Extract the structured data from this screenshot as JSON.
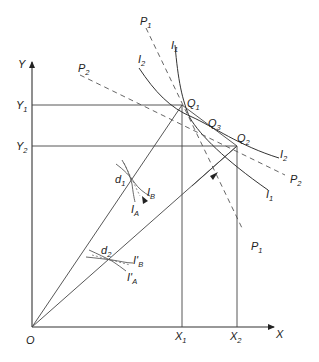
{
  "diagram": {
    "type": "edgeworth-box-style production possibility / isoquant diagram",
    "axes": {
      "origin_label": "O",
      "x_axis_label": "X",
      "y_axis_label": "Y"
    },
    "tick_labels": {
      "x": [
        {
          "main": "X",
          "sub": "1"
        },
        {
          "main": "X",
          "sub": "2"
        }
      ],
      "y": [
        {
          "main": "Y",
          "sub": "1"
        },
        {
          "main": "Y",
          "sub": "2"
        }
      ]
    },
    "points": [
      {
        "main": "Q",
        "sub": "1"
      },
      {
        "main": "Q",
        "sub": "2"
      },
      {
        "main": "Q",
        "sub": "3"
      },
      {
        "main": "d",
        "sub": "1"
      },
      {
        "main": "d",
        "sub": "2"
      }
    ],
    "curves": {
      "I1": {
        "main": "I",
        "sub": "1"
      },
      "I2": {
        "main": "I",
        "sub": "2"
      },
      "I1_end": {
        "main": "I",
        "sub": "1"
      },
      "I2_end": {
        "main": "I",
        "sub": "2"
      }
    },
    "price_lines": {
      "P1_top": {
        "main": "P",
        "sub": "1"
      },
      "P1_bottom": {
        "main": "P",
        "sub": "1"
      },
      "P2_left": {
        "main": "P",
        "sub": "2"
      },
      "P2_right": {
        "main": "P",
        "sub": "2"
      }
    },
    "isoquants_d1": {
      "IB": {
        "main": "I",
        "sub": "B"
      },
      "IA": {
        "main": "I",
        "sub": "A"
      }
    },
    "isoquants_d2": {
      "IB": {
        "main": "I'",
        "sub": "B"
      },
      "IA": {
        "main": "I'",
        "sub": "A"
      }
    },
    "colors": {
      "line": "#333333",
      "background": "#ffffff"
    }
  }
}
